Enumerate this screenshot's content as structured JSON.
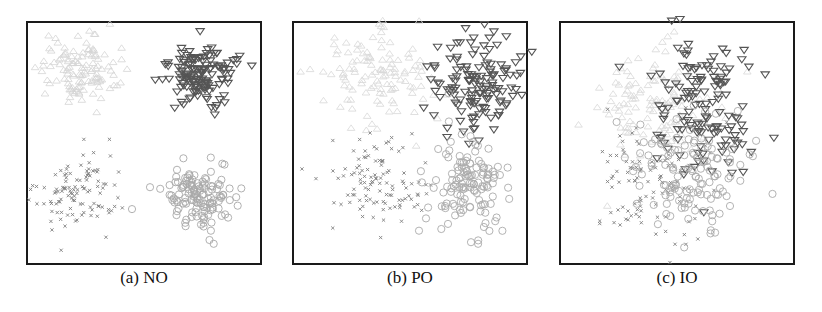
{
  "figure": {
    "panels": [
      {
        "id": "a",
        "caption": "(a) NO",
        "left": 26
      },
      {
        "id": "b",
        "caption": "(b) PO",
        "left": 292
      },
      {
        "id": "c",
        "caption": "(c) IO",
        "left": 559
      }
    ]
  },
  "chart_data": [
    {
      "type": "scatter",
      "title": "(a) NO",
      "xlabel": "",
      "ylabel": "",
      "axes": "hidden (frame only)",
      "grid": false,
      "legend": "none",
      "xlim": [
        0,
        1
      ],
      "ylim": [
        0,
        1
      ],
      "series": [
        {
          "name": "class-1",
          "marker": "triangle-up",
          "color": "#d4d4d4",
          "n": 120,
          "center": [
            0.22,
            0.8
          ],
          "spread": [
            0.08,
            0.07
          ]
        },
        {
          "name": "class-2",
          "marker": "triangle-down",
          "color": "#555555",
          "n": 140,
          "center": [
            0.74,
            0.78
          ],
          "spread": [
            0.07,
            0.06
          ]
        },
        {
          "name": "class-3",
          "marker": "x",
          "color": "#808080",
          "n": 110,
          "center": [
            0.22,
            0.3
          ],
          "spread": [
            0.08,
            0.08
          ]
        },
        {
          "name": "class-4",
          "marker": "circle",
          "color": "#a8a8a8",
          "n": 130,
          "center": [
            0.73,
            0.27
          ],
          "spread": [
            0.07,
            0.07
          ]
        }
      ]
    },
    {
      "type": "scatter",
      "title": "(b) PO",
      "xlabel": "",
      "ylabel": "",
      "axes": "hidden (frame only)",
      "grid": false,
      "legend": "none",
      "xlim": [
        0,
        1
      ],
      "ylim": [
        0,
        1
      ],
      "series": [
        {
          "name": "class-1",
          "marker": "triangle-up",
          "color": "#d8d8d8",
          "n": 120,
          "center": [
            0.34,
            0.76
          ],
          "spread": [
            0.12,
            0.1
          ]
        },
        {
          "name": "class-2",
          "marker": "triangle-down",
          "color": "#555555",
          "n": 140,
          "center": [
            0.78,
            0.74
          ],
          "spread": [
            0.09,
            0.09
          ]
        },
        {
          "name": "class-3",
          "marker": "x",
          "color": "#808080",
          "n": 110,
          "center": [
            0.36,
            0.34
          ],
          "spread": [
            0.1,
            0.09
          ]
        },
        {
          "name": "class-4",
          "marker": "circle",
          "color": "#aaaaaa",
          "n": 130,
          "center": [
            0.74,
            0.34
          ],
          "spread": [
            0.09,
            0.11
          ]
        }
      ]
    },
    {
      "type": "scatter",
      "title": "(c) IO",
      "xlabel": "",
      "ylabel": "",
      "axes": "hidden (frame only)",
      "grid": false,
      "legend": "none",
      "xlim": [
        0,
        1
      ],
      "ylim": [
        0,
        1
      ],
      "series": [
        {
          "name": "class-1",
          "marker": "triangle-up",
          "color": "#d8d8d8",
          "n": 120,
          "center": [
            0.4,
            0.66
          ],
          "spread": [
            0.13,
            0.12
          ]
        },
        {
          "name": "class-2",
          "marker": "triangle-down",
          "color": "#555555",
          "n": 140,
          "center": [
            0.62,
            0.64
          ],
          "spread": [
            0.12,
            0.13
          ]
        },
        {
          "name": "class-3",
          "marker": "x",
          "color": "#808080",
          "n": 110,
          "center": [
            0.4,
            0.32
          ],
          "spread": [
            0.12,
            0.12
          ]
        },
        {
          "name": "class-4",
          "marker": "circle",
          "color": "#aaaaaa",
          "n": 130,
          "center": [
            0.55,
            0.38
          ],
          "spread": [
            0.12,
            0.12
          ]
        }
      ]
    }
  ]
}
